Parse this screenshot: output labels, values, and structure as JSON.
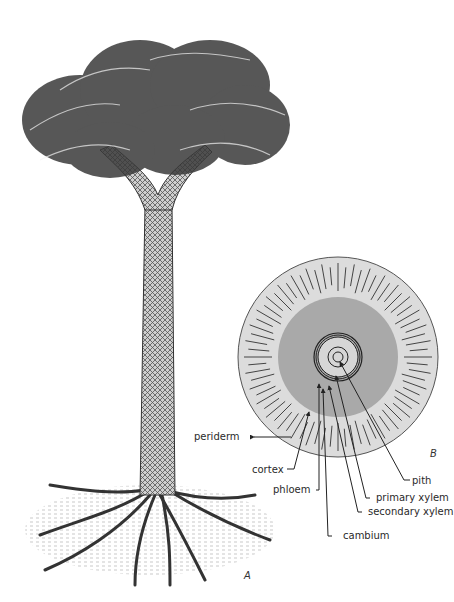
{
  "figure": {
    "panels": {
      "a": "A",
      "b": "B"
    },
    "labels": {
      "periderm": "periderm",
      "cortex": "cortex",
      "phloem": "phloem",
      "cambium": "cambium",
      "secondary_xylem": "secondary xylem",
      "primary_xylem": "primary xylem",
      "pith": "pith"
    },
    "colors": {
      "periderm_fill": "#dcdcdc",
      "cortex_fill": "#a9a9a9",
      "stele_fill": "#d6d6d6",
      "ink": "#222222"
    }
  }
}
